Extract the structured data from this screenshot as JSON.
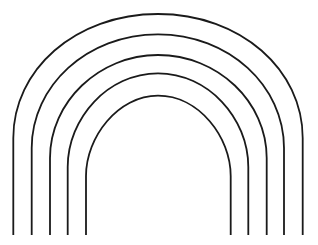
{
  "figure": {
    "canvas": {
      "width": 318,
      "height": 245,
      "background_color": "#ffffff"
    },
    "style": {
      "stroke_color": "#1a1a1a",
      "stroke_width": 1.8,
      "fill": "none"
    },
    "geometry": {
      "center_x": 158,
      "baseline_y": 235,
      "arch_count": 5
    },
    "arches": [
      {
        "index": 1,
        "name": "arch-outer",
        "left_leg_x": 13.3,
        "right_leg_x": 302.7,
        "apex_y": 14,
        "radius_x": 144.7,
        "shoulder_y": 138,
        "path": "M 13.3 235 L 13.3 138 C 13.3 70 75 14 158 14 C 241 14 302.7 70 302.7 138 L 302.7 235"
      },
      {
        "index": 2,
        "name": "arch-second",
        "left_leg_x": 31.7,
        "right_leg_x": 284,
        "apex_y": 34.3,
        "radius_x": 126.2,
        "shoulder_y": 148,
        "path": "M 31.7 235 L 31.7 148 C 31.7 86 87 34.3 158 34.3 C 229 34.3 284 86 284 148 L 284 235"
      },
      {
        "index": 3,
        "name": "arch-third",
        "left_leg_x": 50,
        "right_leg_x": 266.7,
        "apex_y": 55,
        "radius_x": 108.4,
        "shoulder_y": 158,
        "path": "M 50 235 L 50 158 C 50 102 99 55 158 55 C 218 55 266.7 102 266.7 158 L 266.7 235"
      },
      {
        "index": 4,
        "name": "arch-fourth",
        "left_leg_x": 67.7,
        "right_leg_x": 248.3,
        "apex_y": 73.3,
        "radius_x": 90.3,
        "shoulder_y": 167,
        "path": "M 67.7 235 L 67.7 167 C 67.7 118 108 73.3 158 73.3 C 208 73.3 248.3 118 248.3 167 L 248.3 235"
      },
      {
        "index": 5,
        "name": "arch-inner",
        "left_leg_x": 86,
        "right_leg_x": 230.7,
        "apex_y": 95.7,
        "radius_x": 72.4,
        "shoulder_y": 176,
        "path": "M 86 235 L 86 176 C 86 137 118 95.7 158 95.7 C 199 95.7 230.7 137 230.7 176 L 230.7 235"
      }
    ]
  }
}
